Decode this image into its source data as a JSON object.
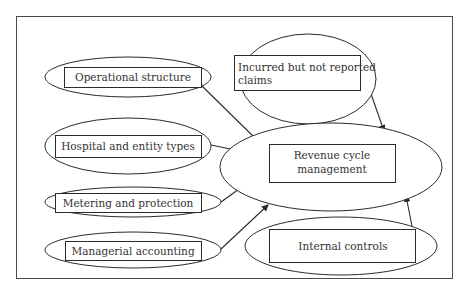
{
  "diagram": {
    "colors": {
      "stroke": "#2b2b2b",
      "text": "#333333",
      "background": "#ffffff"
    },
    "center_node": {
      "id": "revenue",
      "label_lines": [
        "Revenue cycle",
        "management"
      ]
    },
    "nodes": [
      {
        "id": "operational",
        "label_lines": [
          "Operational structure"
        ]
      },
      {
        "id": "hospital",
        "label_lines": [
          "Hospital and entity types"
        ]
      },
      {
        "id": "metering",
        "label_lines": [
          "Metering and protection"
        ]
      },
      {
        "id": "managerial",
        "label_lines": [
          "Managerial accounting"
        ]
      },
      {
        "id": "ibnr",
        "label_lines": [
          "Incurred but not reported",
          "claims"
        ]
      },
      {
        "id": "internal",
        "label_lines": [
          "Internal controls"
        ]
      }
    ],
    "edges": [
      {
        "from": "operational",
        "to": "revenue"
      },
      {
        "from": "hospital",
        "to": "revenue"
      },
      {
        "from": "metering",
        "to": "revenue"
      },
      {
        "from": "managerial",
        "to": "revenue"
      },
      {
        "from": "ibnr",
        "to": "revenue"
      },
      {
        "from": "internal",
        "to": "revenue"
      }
    ]
  }
}
